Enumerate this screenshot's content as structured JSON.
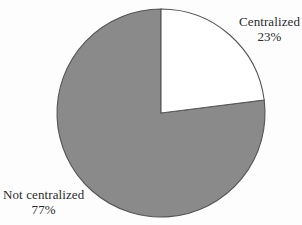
{
  "chart_data": {
    "type": "pie",
    "title": "",
    "categories": [
      "Centralized",
      "Not centralized"
    ],
    "values": [
      23,
      77
    ],
    "value_unit": "%",
    "labels": [
      {
        "name": "Centralized",
        "value": "23%",
        "color": "#ffffff",
        "position": "right-top"
      },
      {
        "name": "Not centralized",
        "value": "77%",
        "color": "#8a8a8a",
        "position": "left-bottom"
      }
    ],
    "start_angle_deg": 0,
    "direction": "clockwise",
    "legend": "none",
    "grid": false,
    "slice_colors": [
      "#ffffff",
      "#8a8a8a"
    ],
    "outline_color": "#555555",
    "background": "#fdfdfd"
  },
  "slices": [
    {
      "label": "Centralized",
      "percent": "23%",
      "fill": "#ffffff"
    },
    {
      "label": "Not centralized",
      "percent": "77%",
      "fill": "#8a8a8a"
    }
  ]
}
